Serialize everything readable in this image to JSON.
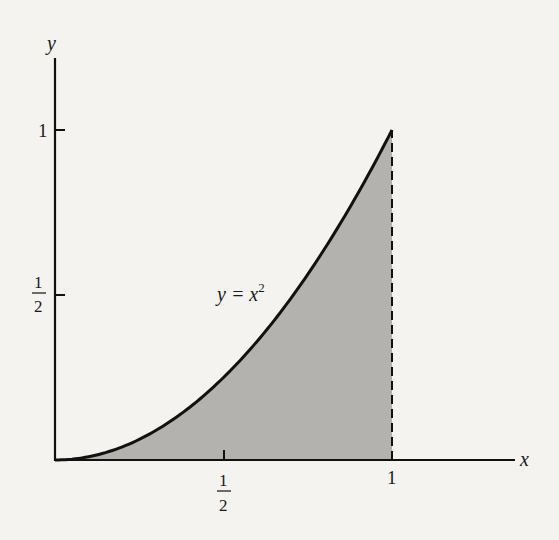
{
  "chart_data": {
    "type": "area",
    "title": "",
    "function": "y = x^2",
    "curve_label": "y = x",
    "curve_label_exponent": "2",
    "xlabel": "x",
    "ylabel": "y",
    "xlim": [
      0,
      1.4
    ],
    "ylim": [
      0,
      1.3
    ],
    "x_ticks": [
      {
        "value": 0.5,
        "label_num": "1",
        "label_den": "2"
      },
      {
        "value": 1,
        "label": "1"
      }
    ],
    "y_ticks": [
      {
        "value": 0.5,
        "label_num": "1",
        "label_den": "2"
      },
      {
        "value": 1,
        "label": "1"
      }
    ],
    "shaded_region": {
      "from_x": 0,
      "to_x": 1,
      "under": "y = x^2"
    },
    "dashed_line": {
      "x": 1,
      "from_y": 0,
      "to_y": 1
    },
    "grid": false,
    "legend": "none",
    "x": [
      0,
      0.1,
      0.2,
      0.3,
      0.4,
      0.5,
      0.6,
      0.7,
      0.8,
      0.9,
      1.0
    ],
    "values": [
      0,
      0.01,
      0.04,
      0.09,
      0.16,
      0.25,
      0.36,
      0.49,
      0.64,
      0.81,
      1.0
    ]
  },
  "colors": {
    "background": "#f4f3f0",
    "shade": "#b3b2ae",
    "ink": "#111111"
  }
}
